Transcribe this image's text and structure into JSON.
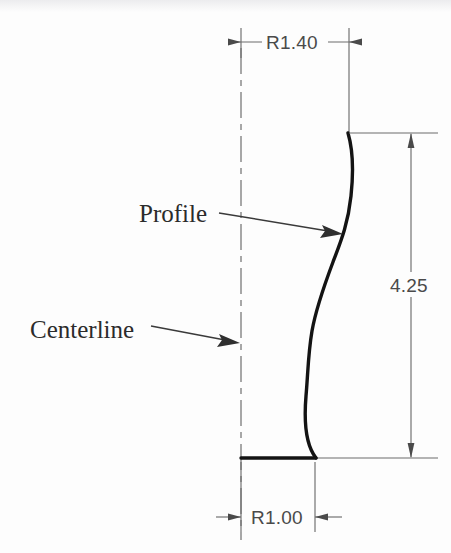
{
  "drawing": {
    "title": "Profile tolerance drawing",
    "background_color": "#fdfdfd",
    "line_color": "#6d6d6d",
    "profile_color": "#131313",
    "text_color": "#4a4a4a",
    "note_color": "#2b2b2b"
  },
  "dimensions": {
    "top_radius": {
      "label": "R1.40",
      "orientation": "horizontal",
      "arrow_style": "outside-pointing-in",
      "y": 42,
      "x_left": 241,
      "x_right": 349
    },
    "height": {
      "label": "4.25",
      "orientation": "vertical",
      "arrow_style": "inside-pointing-out",
      "x": 411,
      "y_top": 133,
      "y_bottom": 458
    },
    "bottom_radius": {
      "label": "R1.00",
      "orientation": "horizontal",
      "arrow_style": "outside-pointing-in",
      "y": 517,
      "x_left": 241,
      "x_right": 315
    }
  },
  "annotations": {
    "profile": {
      "label": "Profile",
      "text_x": 139,
      "text_y": 222,
      "leader_from_x": 219,
      "leader_from_y": 213,
      "leader_to_x": 341,
      "leader_to_y": 233
    },
    "centerline": {
      "label": "Centerline",
      "text_x": 30,
      "text_y": 338,
      "leader_from_x": 151,
      "leader_from_y": 326,
      "leader_to_x": 238,
      "leader_to_y": 343
    }
  },
  "geometry": {
    "centerline": {
      "x": 241,
      "y_top": 48,
      "y_bottom": 540
    },
    "base_line": {
      "x_start": 241,
      "x_end": 316,
      "y": 458
    },
    "profile_curve": "M 348 133 C 353 150 354 168 351 196 C 348 224 341 241 333 262 C 324 286 316 308 312 331 C 308 354 308 374 306 396 C 304 420 305 444 316 458"
  }
}
